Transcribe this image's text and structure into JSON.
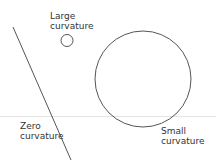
{
  "labels": {
    "large": [
      "Large",
      "curvature"
    ],
    "zero": [
      "Zero",
      "curvature"
    ],
    "small": [
      "Small",
      "curvature"
    ]
  },
  "shapes": {
    "stroke_color": "#555555",
    "baseline_color": "#e6e6e6"
  }
}
